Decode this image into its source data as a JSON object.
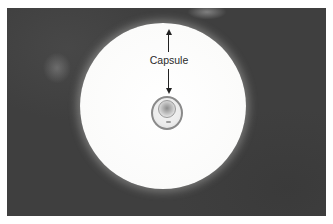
{
  "figure": {
    "annotation": {
      "label": "Capsule",
      "arrows": [
        "up",
        "down"
      ]
    },
    "colors": {
      "background": "#3f3f3f",
      "halo": "#fbfbfa",
      "label_text": "#2a2a2a",
      "arrow": "#222222"
    }
  }
}
